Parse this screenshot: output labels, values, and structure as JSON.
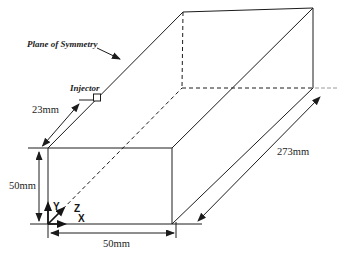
{
  "figure": {
    "background": "#ffffff",
    "line_color": "#1c1c1c",
    "labels": {
      "plane_of_symmetry": "Plane of Symmetry",
      "injector": "Injector"
    },
    "dimensions": {
      "injector_offset": "23mm",
      "duct_height": "50mm",
      "duct_width": "50mm",
      "duct_length": "273mm"
    },
    "axes": {
      "x": "X",
      "y": "Y",
      "z": "Z"
    }
  }
}
